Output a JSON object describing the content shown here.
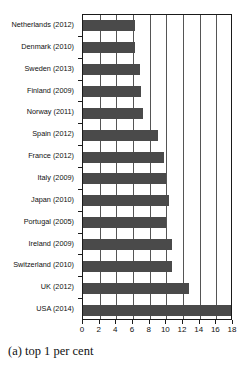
{
  "chart_data": {
    "type": "bar",
    "orientation": "horizontal",
    "title": "",
    "caption": "(a) top 1 per cent",
    "xlabel": "",
    "ylabel": "",
    "xlim": [
      0,
      18
    ],
    "ylim": null,
    "grid": true,
    "legend": null,
    "bar_color": "#4a4a4a",
    "axis_color": "#1a1a1a",
    "gridline_color": "#555555",
    "xticks": [
      0,
      2,
      4,
      6,
      8,
      10,
      12,
      14,
      16,
      18
    ],
    "xticklabels": [
      "0",
      "2",
      "4",
      "6",
      "8",
      "10",
      "12",
      "14",
      "16",
      "18"
    ],
    "categories": [
      "Netherlands (2012)",
      "Denmark (2010)",
      "Sweden (2013)",
      "Finland (2009)",
      "Norway (2011)",
      "Spain (2012)",
      "France (2012)",
      "Italy (2009)",
      "Japan (2010)",
      "Portugal (2005)",
      "Ireland (2009)",
      "Switzerland (2010)",
      "UK (2012)",
      "USA (2014)"
    ],
    "values": [
      6.2,
      6.2,
      6.8,
      6.9,
      7.2,
      9.0,
      9.7,
      10.0,
      10.3,
      10.0,
      10.7,
      10.7,
      12.7,
      18.0
    ]
  }
}
